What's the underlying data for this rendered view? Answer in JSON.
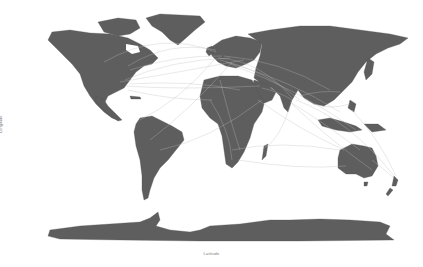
{
  "plot": {
    "xlabel": "Latitude",
    "ylabel": "Longitude",
    "background": "#ffffff",
    "land_color": "#5e5e5e",
    "route_color": "#bdbdbd"
  },
  "map": {
    "type": "world-map-with-connections",
    "regions": [
      "North America",
      "Greenland",
      "South America",
      "Europe",
      "Africa",
      "Asia",
      "Australia",
      "New Zealand",
      "Antarctica",
      "Indonesia",
      "Japan",
      "Madagascar",
      "United Kingdom"
    ],
    "hubs": [
      "Eastern US",
      "Western Europe",
      "Middle East",
      "India",
      "Southeast Asia",
      "Eastern Australia"
    ]
  }
}
